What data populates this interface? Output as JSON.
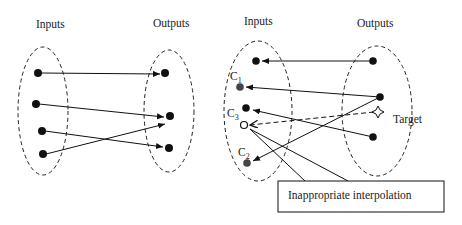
{
  "left_panel": {
    "inputs_label": "Inputs",
    "outputs_label": "Outputs",
    "input_nodes": [
      [
        38,
        73
      ],
      [
        36,
        104
      ],
      [
        42,
        131
      ],
      [
        43,
        154
      ]
    ],
    "output_nodes": [
      [
        165,
        73
      ],
      [
        170,
        116
      ],
      [
        169,
        148
      ]
    ],
    "arrows": [
      {
        "from": 0,
        "to": 0
      },
      {
        "from": 1,
        "to": 1
      },
      {
        "from": 2,
        "to": 2
      },
      {
        "from": 3,
        "to": 1
      }
    ]
  },
  "right_panel": {
    "inputs_label": "Inputs",
    "outputs_label": "Outputs",
    "input_nodes": [
      {
        "id": "n1",
        "label": "",
        "pos": [
          256,
          61
        ],
        "style": "filled"
      },
      {
        "id": "C1",
        "label": "C",
        "sub": "1",
        "pos": [
          240,
          87
        ],
        "style": "gray"
      },
      {
        "id": "C3",
        "label": "C",
        "sub": "3",
        "pos": [
          246,
          108
        ],
        "style": "filled"
      },
      {
        "id": "interp",
        "label": "",
        "pos": [
          244,
          125
        ],
        "style": "open"
      },
      {
        "id": "C2",
        "label": "C",
        "sub": "2",
        "pos": [
          247,
          163
        ],
        "style": "gray"
      }
    ],
    "output_nodes": [
      [
        373,
        61
      ],
      [
        380,
        97
      ],
      [
        373,
        137
      ]
    ],
    "target_label": "Target",
    "callout_text": "Inappropriate interpolation"
  }
}
